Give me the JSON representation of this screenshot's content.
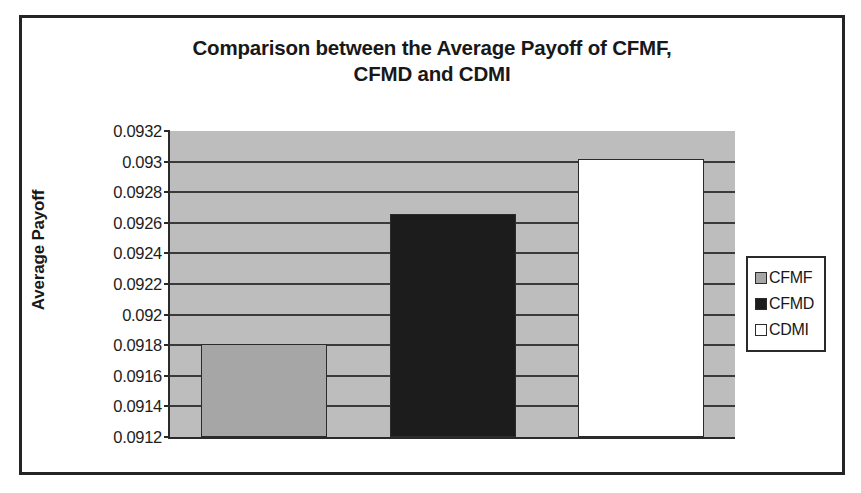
{
  "chart_data": {
    "type": "bar",
    "title": "Comparison between the Average Payoff of CFMF, CFMD and CDMI",
    "title_lines": [
      "Comparison between the Average Payoff of CFMF,",
      "CFMD and CDMI"
    ],
    "xlabel": "",
    "ylabel": "Average Payoff",
    "ylim": [
      0.0912,
      0.0932
    ],
    "ytick_step": 0.0002,
    "ytick_labels": [
      "0.0932",
      "0.093",
      "0.0928",
      "0.0926",
      "0.0924",
      "0.0922",
      "0.092",
      "0.0918",
      "0.0916",
      "0.0914",
      "0.0912"
    ],
    "ytick_values": [
      0.0932,
      0.093,
      0.0928,
      0.0926,
      0.0924,
      0.0922,
      0.092,
      0.0918,
      0.0916,
      0.0914,
      0.0912
    ],
    "grid": true,
    "grid_axis": "y",
    "legend_position": "right",
    "categories": [
      "CFMF",
      "CFMD",
      "CDMI"
    ],
    "values": [
      0.09181,
      0.09266,
      0.09302
    ],
    "series": [
      {
        "name": "CFMF",
        "value": 0.09181,
        "color": "#a6a6a6"
      },
      {
        "name": "CFMD",
        "value": 0.09266,
        "color": "#1c1c1c"
      },
      {
        "name": "CDMI",
        "value": 0.09302,
        "color": "#ffffff"
      }
    ],
    "plot_background": "#bdbdbd",
    "axis_color": "#2a2a2a"
  },
  "legend": {
    "items": [
      {
        "label": "CFMF",
        "swatch": "#a6a6a6"
      },
      {
        "label": "CFMD",
        "swatch": "#1c1c1c"
      },
      {
        "label": "CDMI",
        "swatch": "#ffffff"
      }
    ]
  }
}
